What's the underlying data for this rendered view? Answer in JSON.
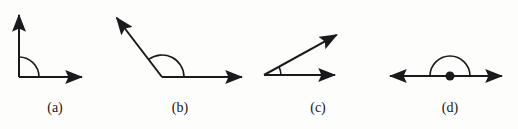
{
  "figure": {
    "background_color": "#fdfdfb",
    "stroke_color": "#1a1a1d",
    "stroke_width": 2.0,
    "width": 518,
    "height": 129,
    "panels": [
      {
        "key": "a",
        "label": "(a)",
        "label_x": 55,
        "label_y": 100,
        "angle_name": "right angle",
        "angle_degrees": 90,
        "vertex": {
          "x": 19,
          "y": 77
        },
        "marker": {
          "type": "arc",
          "radius": 20,
          "start_deg": 0,
          "end_deg": 90
        },
        "vertex_dot": false,
        "rays": [
          {
            "name": "ray-vertical-up",
            "to_x": 19,
            "to_y": 9,
            "arrow": true
          },
          {
            "name": "ray-horizontal-right",
            "to_x": 88,
            "to_y": 77,
            "arrow": true
          }
        ]
      },
      {
        "key": "b",
        "label": "(b)",
        "label_x": 180,
        "label_y": 100,
        "angle_name": "obtuse angle",
        "angle_degrees": 127,
        "vertex": {
          "x": 162,
          "y": 77
        },
        "marker": {
          "type": "arc",
          "radius": 22,
          "start_deg": 0,
          "end_deg": 127
        },
        "vertex_dot": false,
        "rays": [
          {
            "name": "ray-upper-left",
            "to_x": 113,
            "to_y": 13,
            "arrow": true
          },
          {
            "name": "ray-horizontal-right",
            "to_x": 248,
            "to_y": 77,
            "arrow": true
          }
        ]
      },
      {
        "key": "c",
        "label": "(c)",
        "label_x": 318,
        "label_y": 100,
        "angle_name": "acute angle",
        "angle_degrees": 29,
        "vertex": {
          "x": 264,
          "y": 75
        },
        "marker": {
          "type": "arc",
          "radius": 17,
          "start_deg": 0,
          "end_deg": 29
        },
        "vertex_dot": false,
        "rays": [
          {
            "name": "ray-upper-right",
            "to_x": 342,
            "to_y": 32,
            "arrow": true
          },
          {
            "name": "ray-horizontal-right",
            "to_x": 341,
            "to_y": 75,
            "arrow": true
          }
        ]
      },
      {
        "key": "d",
        "label": "(d)",
        "label_x": 450,
        "label_y": 100,
        "angle_name": "straight angle",
        "angle_degrees": 180,
        "vertex": {
          "x": 450,
          "y": 76
        },
        "marker": {
          "type": "arc",
          "radius": 20,
          "start_deg": 0,
          "end_deg": 180
        },
        "vertex_dot": true,
        "vertex_dot_radius": 4.5,
        "rays": [
          {
            "name": "ray-horizontal-left",
            "to_x": 384,
            "to_y": 76,
            "arrow": true
          },
          {
            "name": "ray-horizontal-right",
            "to_x": 508,
            "to_y": 76,
            "arrow": true
          }
        ]
      }
    ]
  }
}
